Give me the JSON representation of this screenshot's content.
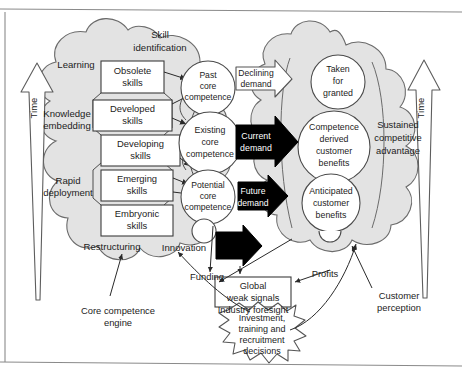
{
  "figure": {
    "colors": {
      "cloud_fill": "#e3e3e3",
      "cloud_stroke": "#6b6b6b",
      "circle_fill": "#ffffff",
      "circle_stroke": "#4a4a4a",
      "box_fill": "#ffffff",
      "box_stroke": "#3c3c3c",
      "black_arrow": "#000000",
      "white_arrow_fill": "#ffffff",
      "frame_line": "#8a8a8a",
      "text": "#1c1c1c"
    }
  },
  "axes": {
    "left_time_label": "Time",
    "right_time_label": "Time"
  },
  "left_cloud": {
    "labels": [
      {
        "text": "Skill",
        "x": 160,
        "y": 37
      },
      {
        "text": "identification",
        "x": 160,
        "y": 50
      },
      {
        "text": "Learning",
        "x": 76,
        "y": 65
      },
      {
        "text": "Knowledge",
        "x": 67,
        "y": 116
      },
      {
        "text": "embedding",
        "x": 67,
        "y": 128
      },
      {
        "text": "Rapid",
        "x": 68,
        "y": 183
      },
      {
        "text": "deployment",
        "x": 68,
        "y": 195
      },
      {
        "text": "Restructuring",
        "x": 111,
        "y": 247
      },
      {
        "text": "Innovation",
        "x": 183,
        "y": 248
      }
    ]
  },
  "skill_boxes": [
    {
      "id": "obsolete",
      "line1": "Obsolete",
      "line2": "skills"
    },
    {
      "id": "developed",
      "line1": "Developed",
      "line2": "skills"
    },
    {
      "id": "developing",
      "line1": "Developing",
      "line2": "skills"
    },
    {
      "id": "emerging",
      "line1": "Emerging",
      "line2": "skills"
    },
    {
      "id": "embryonic",
      "line1": "Embryonic",
      "line2": "skills"
    }
  ],
  "competence_circles": [
    {
      "id": "past",
      "lines": [
        "Past",
        "core",
        "competence"
      ]
    },
    {
      "id": "existing",
      "lines": [
        "Existing",
        "core",
        "competence"
      ]
    },
    {
      "id": "potential",
      "lines": [
        "Potential",
        "core",
        "competence"
      ]
    }
  ],
  "benefit_circles": [
    {
      "id": "taken-for-granted",
      "lines": [
        "Taken",
        "for",
        "granted"
      ]
    },
    {
      "id": "competence-derived-customer-benefits",
      "lines": [
        "Competence",
        "derived",
        "customer",
        "benefits"
      ]
    },
    {
      "id": "anticipated-customer-benefits",
      "lines": [
        "Anticipated",
        "customer",
        "benefits"
      ]
    }
  ],
  "right_cloud": {
    "labels": [
      {
        "text": "Sustained",
        "x": 398,
        "y": 125
      },
      {
        "text": "competitive",
        "x": 398,
        "y": 138
      },
      {
        "text": "advantage",
        "x": 398,
        "y": 151
      }
    ]
  },
  "demand_arrows": [
    {
      "id": "declining-demand",
      "line1": "Declining",
      "line2": "demand",
      "style": "outline"
    },
    {
      "id": "current-demand",
      "line1": "Current",
      "line2": "demand",
      "style": "filled"
    },
    {
      "id": "future-demand",
      "line1": "Future",
      "line2": "demand",
      "style": "filled"
    },
    {
      "id": "unlabelled-demand",
      "line1": "",
      "line2": "",
      "style": "filled"
    }
  ],
  "global_box": {
    "line1": "Global",
    "line2": "weak signals"
  },
  "starburst": {
    "lines": [
      "Investment,",
      "training and",
      "recruitment",
      "decisions"
    ]
  },
  "callouts": [
    {
      "id": "core-competence-engine",
      "line1": "Core competence",
      "line2": "engine"
    },
    {
      "id": "funding",
      "line1": "Funding",
      "line2": ""
    },
    {
      "id": "industry-foresight",
      "line1": "Industry foresight",
      "line2": ""
    },
    {
      "id": "profits",
      "line1": "Profits",
      "line2": ""
    },
    {
      "id": "customer-perception",
      "line1": "Customer",
      "line2": "perception"
    }
  ]
}
